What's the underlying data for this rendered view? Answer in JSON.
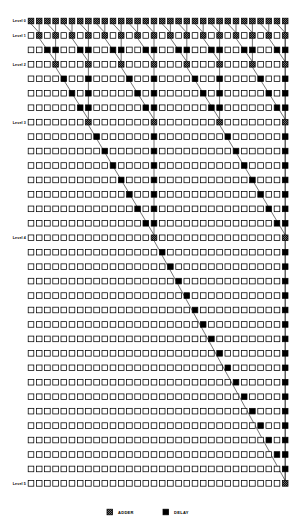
{
  "figure": {
    "grid": {
      "columns": 32,
      "rows": 33,
      "origin_x": 31,
      "origin_y": 21,
      "col_pitch": 8.2,
      "row_pitch": 14.45,
      "cell_size": 5.6
    },
    "colors": {
      "empty_fill": "#ffffff",
      "delay_fill": "#000000",
      "adder_fill": "#000000",
      "stroke": "#000000",
      "line": "#000000",
      "background": "#ffffff"
    },
    "cell_types": {
      "empty": "empty",
      "adder": "adder",
      "delay": "delay"
    },
    "level_labels": [
      {
        "text": "Level 0",
        "row": 0
      },
      {
        "text": "Level 1",
        "row": 1
      },
      {
        "text": "Level 2",
        "row": 3
      },
      {
        "text": "Level 3",
        "row": 7
      },
      {
        "text": "Level 4",
        "row": 15
      },
      {
        "text": "Level 5",
        "row": 32
      }
    ],
    "stages": [
      {
        "level": 0,
        "adder_row": 0,
        "adder_period": 1,
        "adder_offset": 0
      },
      {
        "level": 1,
        "adder_row": 1,
        "adder_period": 2,
        "adder_offset": 1
      },
      {
        "level": 2,
        "adder_row": 3,
        "adder_period": 4,
        "adder_offset": 3
      },
      {
        "level": 3,
        "adder_row": 7,
        "adder_period": 8,
        "adder_offset": 7
      },
      {
        "level": 4,
        "adder_row": 15,
        "adder_period": 16,
        "adder_offset": 15
      },
      {
        "level": 5,
        "adder_row": 32,
        "adder_period": 32,
        "adder_offset": 31
      }
    ],
    "legend": {
      "items": [
        {
          "symbol": "adder",
          "label": "ADDER"
        },
        {
          "symbol": "delay",
          "label": "DELAY"
        }
      ],
      "y": 512,
      "adder_x": 107,
      "adder_text_x": 118,
      "delay_x": 163,
      "delay_text_x": 174
    }
  }
}
